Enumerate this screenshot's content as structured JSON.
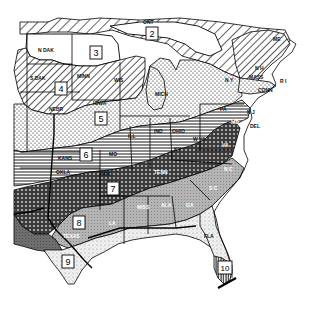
{
  "map": {
    "title": "Eastern United States zone map",
    "zones": [
      {
        "id": "2",
        "label": "2",
        "x": 152,
        "y": 34
      },
      {
        "id": "3",
        "label": "3",
        "x": 96,
        "y": 53
      },
      {
        "id": "4",
        "label": "4",
        "x": 61,
        "y": 89
      },
      {
        "id": "5",
        "label": "5",
        "x": 101,
        "y": 119
      },
      {
        "id": "6",
        "label": "6",
        "x": 86,
        "y": 155
      },
      {
        "id": "7",
        "label": "7",
        "x": 113,
        "y": 189
      },
      {
        "id": "8",
        "label": "8",
        "x": 79,
        "y": 223
      },
      {
        "id": "9",
        "label": "9",
        "x": 68,
        "y": 262
      },
      {
        "id": "10",
        "label": "10",
        "x": 225,
        "y": 268
      }
    ],
    "states": [
      {
        "label": "ONT",
        "x": 148,
        "y": 24
      },
      {
        "label": "N DAK",
        "x": 42,
        "y": 52
      },
      {
        "label": "S DAK",
        "x": 34,
        "y": 80
      },
      {
        "label": "MINN",
        "x": 81,
        "y": 78
      },
      {
        "label": "WIS",
        "x": 118,
        "y": 82
      },
      {
        "label": "MICH",
        "x": 161,
        "y": 96
      },
      {
        "label": "NEBR",
        "x": 54,
        "y": 111
      },
      {
        "label": "IOWA",
        "x": 97,
        "y": 105
      },
      {
        "label": "ILL",
        "x": 131,
        "y": 138
      },
      {
        "label": "IND",
        "x": 158,
        "y": 133
      },
      {
        "label": "OHIO",
        "x": 176,
        "y": 133
      },
      {
        "label": "KANS",
        "x": 63,
        "y": 160
      },
      {
        "label": "MO",
        "x": 111,
        "y": 156
      },
      {
        "label": "KY",
        "x": 176,
        "y": 151
      },
      {
        "label": "W VA",
        "x": 196,
        "y": 141
      },
      {
        "label": "VA",
        "x": 224,
        "y": 147
      },
      {
        "label": "PA",
        "x": 222,
        "y": 111
      },
      {
        "label": "N Y",
        "x": 228,
        "y": 82
      },
      {
        "label": "N H",
        "x": 258,
        "y": 70
      },
      {
        "label": "ME",
        "x": 276,
        "y": 41
      },
      {
        "label": "MASS",
        "x": 253,
        "y": 79
      },
      {
        "label": "R I",
        "x": 281,
        "y": 83
      },
      {
        "label": "CONN",
        "x": 262,
        "y": 92
      },
      {
        "label": "N J",
        "x": 248,
        "y": 114
      },
      {
        "label": "DEL",
        "x": 251,
        "y": 128
      },
      {
        "label": "MD",
        "x": 233,
        "y": 124
      },
      {
        "label": "OKLA",
        "x": 60,
        "y": 174
      },
      {
        "label": "ARK",
        "x": 103,
        "y": 176
      },
      {
        "label": "TENN",
        "x": 158,
        "y": 174
      },
      {
        "label": "N C",
        "x": 226,
        "y": 171
      },
      {
        "label": "S C",
        "x": 211,
        "y": 190
      },
      {
        "label": "GA",
        "x": 188,
        "y": 207
      },
      {
        "label": "ALA",
        "x": 164,
        "y": 207
      },
      {
        "label": "MISS",
        "x": 141,
        "y": 209
      },
      {
        "label": "LA",
        "x": 111,
        "y": 225
      },
      {
        "label": "TEXAS",
        "x": 69,
        "y": 238
      },
      {
        "label": "FLA",
        "x": 207,
        "y": 238
      }
    ],
    "colors": {
      "ink": "#000000",
      "paper": "#ffffff",
      "zone8_gray": "#a9a9a9",
      "zone9_light": "#e6e6e6",
      "zone_dark": "#3a3a3a"
    }
  }
}
